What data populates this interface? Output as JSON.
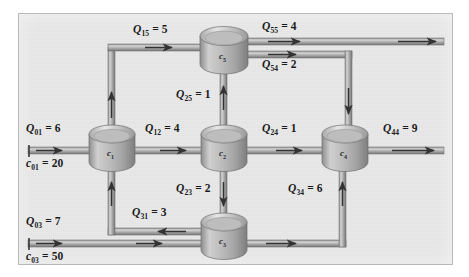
{
  "figure": {
    "type": "diagram",
    "background_color": "#e9e9e9",
    "frame_border_color": "#b9b9b9",
    "pipe_fill_color": "#b0b0b0",
    "pipe_edge_color": "#6a6a6a",
    "arrow_color": "#3a3a3a",
    "tank_body_color": "#c2c2c2",
    "tank_rim_color": "#d8d8d8",
    "text_color": "#1b1b1b"
  },
  "reactors": [
    {
      "id": "c1",
      "label": "c",
      "sub": "1",
      "x": 112,
      "y": 143
    },
    {
      "id": "c2",
      "label": "c",
      "sub": "2",
      "x": 224,
      "y": 143
    },
    {
      "id": "c3",
      "label": "c",
      "sub": "3",
      "x": 224,
      "y": 231
    },
    {
      "id": "c4",
      "label": "c",
      "sub": "4",
      "x": 345,
      "y": 143
    },
    {
      "id": "c5",
      "label": "c",
      "sub": "5",
      "x": 224,
      "y": 47
    }
  ],
  "flows": [
    {
      "name": "Q01",
      "symbol": "Q",
      "sub": "01",
      "eq": "=",
      "value": "6",
      "label": "Q01 = 6",
      "from": "external",
      "to": "c1",
      "direction": "right"
    },
    {
      "name": "c01",
      "symbol": "c",
      "sub": "01",
      "eq": "=",
      "value": "20",
      "label": "c01 = 20",
      "kind": "concentration",
      "stream": "Q01"
    },
    {
      "name": "Q03",
      "symbol": "Q",
      "sub": "03",
      "eq": "=",
      "value": "7",
      "label": "Q03 = 7",
      "from": "external",
      "to": "c3",
      "direction": "right"
    },
    {
      "name": "c03",
      "symbol": "c",
      "sub": "03",
      "eq": "=",
      "value": "50",
      "label": "c03 = 50",
      "kind": "concentration",
      "stream": "Q03"
    },
    {
      "name": "Q12",
      "symbol": "Q",
      "sub": "12",
      "eq": "=",
      "value": "4",
      "label": "Q12 = 4",
      "from": "c1",
      "to": "c2",
      "direction": "right"
    },
    {
      "name": "Q15",
      "symbol": "Q",
      "sub": "15",
      "eq": "=",
      "value": "5",
      "label": "Q15 = 5",
      "from": "c1",
      "to": "c5",
      "direction": "up-right"
    },
    {
      "name": "Q25",
      "symbol": "Q",
      "sub": "25",
      "eq": "=",
      "value": "1",
      "label": "Q25 = 1",
      "from": "c2",
      "to": "c5",
      "direction": "up"
    },
    {
      "name": "Q23",
      "symbol": "Q",
      "sub": "23",
      "eq": "=",
      "value": "2",
      "label": "Q23 = 2",
      "from": "c2",
      "to": "c3",
      "direction": "down"
    },
    {
      "name": "Q24",
      "symbol": "Q",
      "sub": "24",
      "eq": "=",
      "value": "1",
      "label": "Q24 = 1",
      "from": "c2",
      "to": "c4",
      "direction": "right"
    },
    {
      "name": "Q31",
      "symbol": "Q",
      "sub": "31",
      "eq": "=",
      "value": "3",
      "label": "Q31 = 3",
      "from": "c3",
      "to": "c1",
      "direction": "left-up"
    },
    {
      "name": "Q34",
      "symbol": "Q",
      "sub": "34",
      "eq": "=",
      "value": "6",
      "label": "Q34 = 6",
      "from": "c3",
      "to": "c4",
      "direction": "right-up"
    },
    {
      "name": "Q54",
      "symbol": "Q",
      "sub": "54",
      "eq": "=",
      "value": "2",
      "label": "Q54 = 2",
      "from": "c5",
      "to": "c4",
      "direction": "right-down"
    },
    {
      "name": "Q55",
      "symbol": "Q",
      "sub": "55",
      "eq": "=",
      "value": "4",
      "label": "Q55 = 4",
      "from": "c5",
      "to": "external",
      "direction": "right"
    },
    {
      "name": "Q44",
      "symbol": "Q",
      "sub": "44",
      "eq": "=",
      "value": "9",
      "label": "Q44 = 9",
      "from": "c4",
      "to": "external",
      "direction": "right"
    }
  ]
}
